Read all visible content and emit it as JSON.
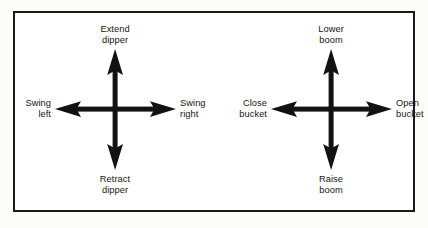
{
  "diagram": {
    "frame": {
      "border_color": "#1a1a1a",
      "fill_color": "#ffffff"
    },
    "arrow_color": "#121212",
    "background_color": "#fcfcfa",
    "crosses": [
      {
        "id": "left-joystick",
        "name": "left-control-cross",
        "center_x": 100,
        "center_y": 96,
        "labels": {
          "up": {
            "line1": "Extend",
            "line2": "dipper"
          },
          "down": {
            "line1": "Retract",
            "line2": "dipper"
          },
          "left": {
            "line1": "Swing",
            "line2": "left"
          },
          "right": {
            "line1": "Swing",
            "line2": "right"
          }
        }
      },
      {
        "id": "right-joystick",
        "name": "right-control-cross",
        "center_x": 115,
        "center_y": 96,
        "labels": {
          "up": {
            "line1": "Lower",
            "line2": "boom"
          },
          "down": {
            "line1": "Raise",
            "line2": "boom"
          },
          "left": {
            "line1": "Close",
            "line2": "bucket"
          },
          "right": {
            "line1": "Open",
            "line2": "bucket"
          }
        }
      }
    ]
  }
}
